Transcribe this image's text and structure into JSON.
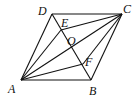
{
  "figure": {
    "type": "geometry",
    "shape": "parallelogram ABCD",
    "points": {
      "A": {
        "label": "A",
        "x": 21,
        "y": 80
      },
      "B": {
        "label": "B",
        "x": 91,
        "y": 80
      },
      "C": {
        "label": "C",
        "x": 122,
        "y": 14
      },
      "D": {
        "label": "D",
        "x": 52,
        "y": 14
      },
      "O": {
        "label": "O",
        "x": 71.5,
        "y": 47
      },
      "E": {
        "label": "E",
        "x": 61,
        "y": 33
      },
      "F": {
        "label": "F",
        "x": 82,
        "y": 63
      }
    },
    "segments": [
      "AB",
      "BC",
      "CD",
      "DA",
      "AC",
      "BD",
      "AE",
      "AF",
      "CE",
      "CF"
    ]
  }
}
